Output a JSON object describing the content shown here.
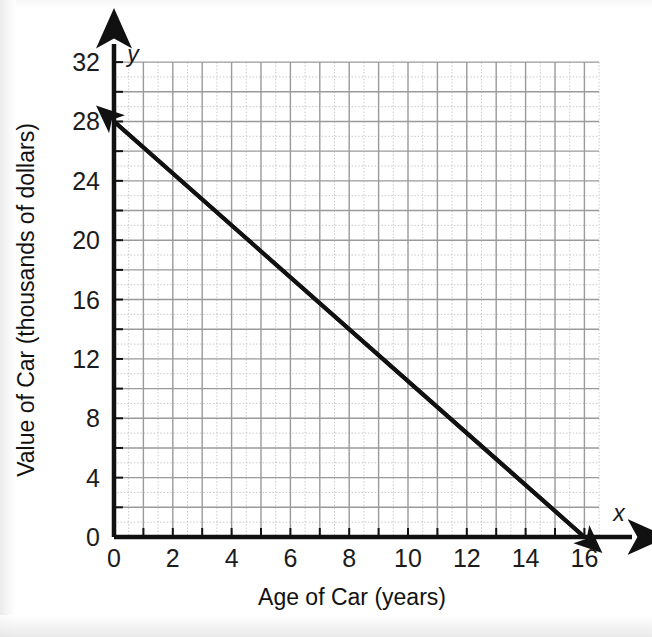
{
  "chart_data": {
    "type": "line",
    "title": "",
    "xlabel": "Age of Car (years)",
    "ylabel": "Value of Car (thousands of dollars)",
    "x_axis_name": "x",
    "y_axis_name": "y",
    "xlim": [
      0,
      17.5
    ],
    "ylim": [
      0,
      34
    ],
    "x_tick_labels": [
      "0",
      "2",
      "4",
      "6",
      "8",
      "10",
      "12",
      "14",
      "16"
    ],
    "x_tick_values": [
      0,
      2,
      4,
      6,
      8,
      10,
      12,
      14,
      16
    ],
    "y_tick_labels": [
      "0",
      "4",
      "8",
      "12",
      "16",
      "20",
      "24",
      "28",
      "32"
    ],
    "y_tick_values": [
      0,
      4,
      8,
      12,
      16,
      20,
      24,
      28,
      32
    ],
    "x_minor_step": 1,
    "y_minor_step": 1,
    "x_major_step": 1,
    "y_major_step": 2,
    "grid": true,
    "grid_major_color": "#9a9a9a",
    "grid_minor_color": "#c9c9c9",
    "legend": "none",
    "line_color": "#111111",
    "line_width": 4,
    "arrows": "both",
    "series": [
      {
        "name": "Value of Car",
        "points": [
          {
            "x": 0,
            "y": 28
          },
          {
            "x": 16,
            "y": 0
          }
        ],
        "equation": "y = -1.75x + 28",
        "slope": -1.75,
        "y_intercept": 28,
        "x_intercept": 16
      }
    ]
  },
  "axes": {
    "x_label": "Age of Car (years)",
    "y_label": "Value of Car (thousands of dollars)",
    "x_symbol": "x",
    "y_symbol": "y"
  },
  "x_ticks": [
    {
      "label": "0",
      "value": 0
    },
    {
      "label": "2",
      "value": 2
    },
    {
      "label": "4",
      "value": 4
    },
    {
      "label": "6",
      "value": 6
    },
    {
      "label": "8",
      "value": 8
    },
    {
      "label": "10",
      "value": 10
    },
    {
      "label": "12",
      "value": 12
    },
    {
      "label": "14",
      "value": 14
    },
    {
      "label": "16",
      "value": 16
    }
  ],
  "y_ticks": [
    {
      "label": "0",
      "value": 0
    },
    {
      "label": "4",
      "value": 4
    },
    {
      "label": "8",
      "value": 8
    },
    {
      "label": "12",
      "value": 12
    },
    {
      "label": "16",
      "value": 16
    },
    {
      "label": "20",
      "value": 20
    },
    {
      "label": "24",
      "value": 24
    },
    {
      "label": "28",
      "value": 28
    },
    {
      "label": "32",
      "value": 32
    }
  ]
}
